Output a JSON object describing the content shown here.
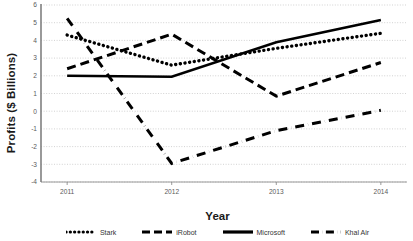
{
  "chart_data": {
    "type": "line",
    "title": "",
    "xlabel": "Year",
    "ylabel": "Profits ($ Billions)",
    "categories": [
      "2011",
      "2012",
      "2013",
      "2014"
    ],
    "x": [
      2011,
      2012,
      2013,
      2014
    ],
    "xlim": [
      2010.75,
      2014.25
    ],
    "ylim": [
      -4,
      6
    ],
    "ytick_labels": [
      "6",
      "5",
      "4",
      "3",
      "2",
      "1",
      "0",
      "-1",
      "-2",
      "-3",
      "-4"
    ],
    "yticks": [
      6,
      5,
      4,
      3,
      2,
      1,
      0,
      -1,
      -2,
      -3,
      -4
    ],
    "grid": true,
    "grid_style": "dotted-horizontal",
    "legend_position": "bottom",
    "series": [
      {
        "name": "Stark",
        "values": [
          4.3,
          2.6,
          3.55,
          4.4
        ],
        "style": "dotted",
        "color": "#000000"
      },
      {
        "name": "iRobot",
        "values": [
          2.4,
          4.35,
          0.85,
          2.75
        ],
        "style": "dashed",
        "color": "#000000"
      },
      {
        "name": "Microsoft",
        "values": [
          2.0,
          1.95,
          3.9,
          5.15
        ],
        "style": "solid",
        "color": "#000000"
      },
      {
        "name": "Khal Air",
        "values": [
          5.25,
          -2.95,
          -1.1,
          0.05
        ],
        "style": "dash-dot",
        "color": "#000000"
      }
    ]
  },
  "axis": {
    "axis_color": "#808080",
    "grid_color": "#bfbfbf",
    "tick_text_color": "#5a5a5a"
  }
}
